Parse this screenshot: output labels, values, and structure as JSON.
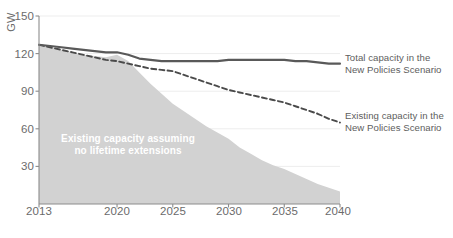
{
  "chart_data": {
    "type": "area",
    "title": "",
    "subtitle": "",
    "xlabel": "",
    "ylabel": "GW",
    "unit": "GW",
    "grid": true,
    "legend_position": "right",
    "xlim": [
      2013,
      2040
    ],
    "ylim": [
      0,
      150
    ],
    "yticks": [
      150,
      120,
      90,
      60,
      30
    ],
    "xticks": [
      2013,
      2020,
      2025,
      2030,
      2035,
      2040
    ],
    "x": [
      2013,
      2014,
      2015,
      2016,
      2017,
      2018,
      2019,
      2020,
      2021,
      2022,
      2023,
      2024,
      2025,
      2026,
      2027,
      2028,
      2029,
      2030,
      2031,
      2032,
      2033,
      2034,
      2035,
      2036,
      2037,
      2038,
      2039,
      2040
    ],
    "series": [
      {
        "name": "Total capacity in the New Policies Scenario",
        "style": "solid-line",
        "color": "#595959",
        "values": [
          127,
          126,
          125,
          124,
          123,
          122,
          121,
          121,
          119,
          116,
          115,
          114,
          114,
          114,
          114,
          114,
          114,
          115,
          115,
          115,
          115,
          115,
          115,
          114,
          114,
          113,
          112,
          112
        ]
      },
      {
        "name": "Existing capacity in the New Policies Scenario",
        "style": "dashed-line",
        "color": "#4a4a4a",
        "values": [
          127,
          125,
          123,
          121,
          119,
          117,
          115,
          114,
          112,
          110,
          108,
          107,
          106,
          103,
          100,
          97,
          94,
          91,
          89,
          87,
          85,
          83,
          81,
          78,
          75,
          72,
          68,
          65
        ]
      },
      {
        "name": "Existing capacity assuming no lifetime extensions",
        "style": "filled-area",
        "color": "#d2d2d2",
        "values": [
          127,
          125,
          123,
          121,
          119,
          118,
          117,
          119,
          114,
          105,
          96,
          88,
          80,
          74,
          68,
          62,
          57,
          52,
          45,
          40,
          35,
          31,
          28,
          24,
          20,
          16,
          13,
          10
        ]
      }
    ],
    "annotations": [
      {
        "text": "Existing capacity assuming no lifetime extensions",
        "text_line1": "Existing capacity assuming",
        "text_line2": "no lifetime extensions",
        "color": "#ffffff"
      }
    ]
  },
  "axes": {
    "y_unit": "GW",
    "y_ticks": [
      "150",
      "120",
      "90",
      "60",
      "30"
    ],
    "x_ticks": [
      "2013",
      "2020",
      "2025",
      "2030",
      "2035",
      "2040"
    ]
  },
  "legend": {
    "total": {
      "line1": "Total capacity in the",
      "line2": "New Policies Scenario"
    },
    "existing": {
      "line1": "Existing capacity in the",
      "line2": "New Policies Scenario"
    }
  },
  "area_annotation": {
    "line1": "Existing capacity assuming",
    "line2": "no lifetime extensions"
  },
  "colors": {
    "area_fill": "#d2d2d2",
    "solid_line": "#595959",
    "dashed_line": "#4a4a4a",
    "axis": "#8c8c8c",
    "text": "#6b6b6b",
    "gridline": "#ededed"
  }
}
